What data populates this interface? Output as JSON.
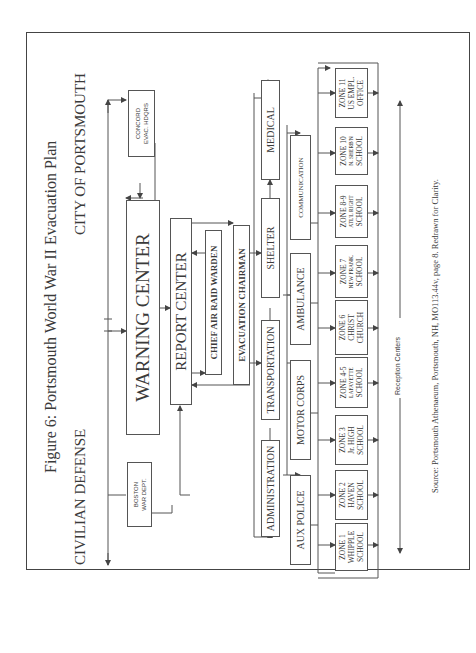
{
  "figure": {
    "title": "Figure 6: Portsmouth World War II Evacuation Plan",
    "left_heading": "CIVILIAN DEFENSE",
    "right_heading": "CITY OF PORTSMOUTH",
    "source": "Source: Portsmouth Athenaeum, Portsmouth, NH, MO113.44v, page 8. Redrawn for Clarity.",
    "reception_label": "Reception Centers"
  },
  "boxes": {
    "boston": {
      "line1": "BOSTON",
      "line2": "WAR DEPT."
    },
    "concord": {
      "line1": "CONCORD",
      "line2": "EVAC. HDQRS"
    },
    "warning_center": "WARNING CENTER",
    "report_center": "REPORT CENTER",
    "chief_air_raid_warden": "CHIEF AIR RAID WARDEN",
    "evacuation_chairman": "EVACUATION CHAIRMAN",
    "administration": "ADMINISTRATION",
    "transportation": "TRANSPORTATION",
    "shelter": "SHELTER",
    "medical": "MEDICAL",
    "aux_police": "AUX POLICE",
    "motor_corps": "MOTOR CORPS",
    "ambulance": "AMBULANCE",
    "communication": "COMMUNICATION"
  },
  "zones": [
    {
      "name": "ZONE 1",
      "place": "WHIPPLE",
      "type": "SCHOOL"
    },
    {
      "name": "ZONE 2",
      "place": "HAVEN",
      "type": "SCHOOL"
    },
    {
      "name": "ZONE 3",
      "place": "Jr. HIGH",
      "type": "SCHOOL"
    },
    {
      "name": "ZONE 4-5",
      "place": "LAFAYETTE",
      "type": "SCHOOL"
    },
    {
      "name": "ZONE 6",
      "place": "CHRIST",
      "type": "CHURCH"
    },
    {
      "name": "ZONE 7",
      "place": "NEW FRANK.",
      "type": "SCHOOL"
    },
    {
      "name": "ZONE 8-9",
      "place": "ATL'L RIGHT",
      "type": "SCHOOL"
    },
    {
      "name": "ZONE 10",
      "place": "N. SHERB'N",
      "type": "SCHOOL"
    },
    {
      "name": "ZONE 11",
      "place": "US EMPL.",
      "type": "OFFICE"
    }
  ]
}
